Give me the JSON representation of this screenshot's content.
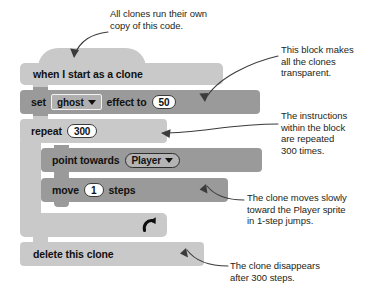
{
  "figure": {
    "type": "scratch-block-script"
  },
  "script": {
    "hat": {
      "label": "when I start as a clone",
      "shape": "hat",
      "color": "#c9c9c9"
    },
    "blocks": [
      {
        "id": "set-effect",
        "shape": "stack",
        "color": "#9a9a9a",
        "text_before": "set",
        "dropdown_value": "ghost",
        "text_middle": "effect to",
        "number_value": "50"
      },
      {
        "id": "repeat",
        "shape": "c-block",
        "color": "#c9c9c9",
        "text_before": "repeat",
        "number_value": "300",
        "loop_arrow": "loop-arrow-icon"
      },
      {
        "id": "point-towards",
        "shape": "stack",
        "color": "#9a9a9a",
        "text_before": "point towards",
        "dropdown_value": "Player"
      },
      {
        "id": "move-steps",
        "shape": "stack",
        "color": "#9a9a9a",
        "text_before": "move",
        "number_value": "1",
        "text_after": "steps"
      },
      {
        "id": "delete-clone",
        "shape": "cap",
        "color": "#c9c9c9",
        "label": "delete this clone"
      }
    ]
  },
  "annotations": [
    {
      "id": "clones-own-copy",
      "text": "All clones run their own\ncopy of this code.",
      "target": "when I start as a clone"
    },
    {
      "id": "transparent",
      "text": "This block makes\nall the clones\ntransparent.",
      "target": "set ghost effect to 50"
    },
    {
      "id": "repeat-300",
      "text": "The instructions\nwithin the block\nare repeated\n300 times.",
      "target": "repeat 300"
    },
    {
      "id": "moves-slowly",
      "text": "The clone moves slowly\ntoward the Player sprite\nin 1-step jumps.",
      "target": "move 1 steps"
    },
    {
      "id": "disappears",
      "text": "The clone disappears\nafter 300 steps.",
      "target": "delete this clone"
    }
  ],
  "colors": {
    "light_block": "#c9c9c9",
    "dark_block": "#9a9a9a",
    "text": "#231f20",
    "background": "#ffffff"
  }
}
